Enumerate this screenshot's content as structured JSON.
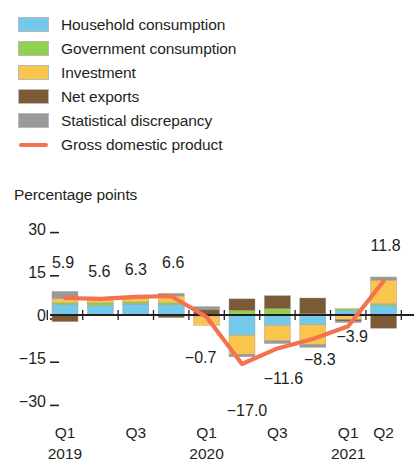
{
  "legend": {
    "items": [
      {
        "label": "Household consumption",
        "color": "#74c8ea",
        "type": "swatch",
        "icon": "legend-swatch"
      },
      {
        "label": "Government consumption",
        "color": "#92d050",
        "type": "swatch",
        "icon": "legend-swatch"
      },
      {
        "label": "Investment",
        "color": "#f9c councils",
        "type": "swatch",
        "icon": "legend-swatch"
      },
      {
        "label": "Net exports",
        "color": "#7b5a35",
        "type": "swatch",
        "icon": "legend-swatch"
      },
      {
        "label": "Statistical discrepancy",
        "color": "#9a9a9a",
        "type": "swatch",
        "icon": "legend-swatch"
      },
      {
        "label": "Gross domestic product",
        "color": "#f4724f",
        "type": "line",
        "icon": "legend-line"
      }
    ]
  },
  "axis_title": "Percentage points",
  "chart_data": {
    "type": "bar",
    "title": "",
    "subtitle": "",
    "xlabel": "",
    "ylabel": "Percentage points",
    "ylim": [
      -33,
      33
    ],
    "yticks": [
      30,
      15,
      0,
      -15,
      -30
    ],
    "ytick_labels": [
      "30",
      "15",
      "0",
      "−15",
      "−30"
    ],
    "grid": false,
    "legend_position": "above-plot",
    "stacked": true,
    "categories": [
      "Q1 2019",
      "Q2 2019",
      "Q3 2019",
      "Q4 2019",
      "Q1 2020",
      "Q2 2020",
      "Q3 2020",
      "Q4 2020",
      "Q1 2021",
      "Q2 2021"
    ],
    "xtick_labels": [
      {
        "at": "Q1 2019",
        "line1": "Q1",
        "line2": "2019"
      },
      {
        "at": "Q3 2019",
        "line1": "Q3",
        "line2": ""
      },
      {
        "at": "Q1 2020",
        "line1": "Q1",
        "line2": "2020"
      },
      {
        "at": "Q3 2020",
        "line1": "Q3",
        "line2": ""
      },
      {
        "at": "Q1 2021",
        "line1": "Q1",
        "line2": "2021"
      },
      {
        "at": "Q2 2021",
        "line1": "Q2",
        "line2": ""
      }
    ],
    "series": [
      {
        "name": "Household consumption",
        "color": "#74c8ea",
        "values": [
          3.6,
          3.3,
          3.8,
          3.6,
          -0.4,
          -7.0,
          -3.6,
          -3.4,
          1.6,
          3.4
        ]
      },
      {
        "name": "Government consumption",
        "color": "#92d050",
        "values": [
          0.6,
          0.9,
          0.7,
          0.6,
          0.2,
          1.6,
          2.2,
          0.4,
          0.6,
          0.5
        ]
      },
      {
        "name": "Investment",
        "color": "#f9c54d",
        "values": [
          1.5,
          1.2,
          1.5,
          2.4,
          -3.2,
          -6.6,
          -5.4,
          -6.9,
          -1.6,
          8.2
        ]
      },
      {
        "name": "Net exports",
        "color": "#7b5a35",
        "values": [
          -2.3,
          0.2,
          0.3,
          -0.9,
          1.8,
          4.0,
          4.5,
          5.5,
          -0.5,
          -4.6
        ]
      },
      {
        "name": "Statistical discrepancy",
        "color": "#9a9a9a",
        "values": [
          2.5,
          0.0,
          0.0,
          0.9,
          0.9,
          -0.9,
          -0.9,
          -0.9,
          -0.5,
          1.1
        ]
      }
    ],
    "gdp_line": {
      "name": "Gross domestic product",
      "color": "#f4724f",
      "values": [
        5.9,
        5.6,
        6.3,
        6.6,
        -0.7,
        -17.0,
        -11.6,
        -8.3,
        -3.9,
        11.8
      ]
    },
    "data_labels": [
      {
        "category": "Q1 2019",
        "text": "5.9"
      },
      {
        "category": "Q2 2019",
        "text": "5.6"
      },
      {
        "category": "Q3 2019",
        "text": "6.3"
      },
      {
        "category": "Q4 2019",
        "text": "6.6"
      },
      {
        "category": "Q1 2020",
        "text": "−0.7"
      },
      {
        "category": "Q2 2020",
        "text": "−17.0"
      },
      {
        "category": "Q3 2020",
        "text": "−11.6"
      },
      {
        "category": "Q4 2020",
        "text": "−8.3"
      },
      {
        "category": "Q1 2021",
        "text": "−3.9"
      },
      {
        "category": "Q2 2021",
        "text": "11.8"
      }
    ]
  },
  "colors": {
    "household": "#74c8ea",
    "government": "#92d050",
    "investment": "#f9c54d",
    "net_exports": "#7b5a35",
    "statistical_discrepancy": "#9a9a9a",
    "gdp": "#f4724f",
    "text": "#231f20",
    "background": "#ffffff"
  }
}
